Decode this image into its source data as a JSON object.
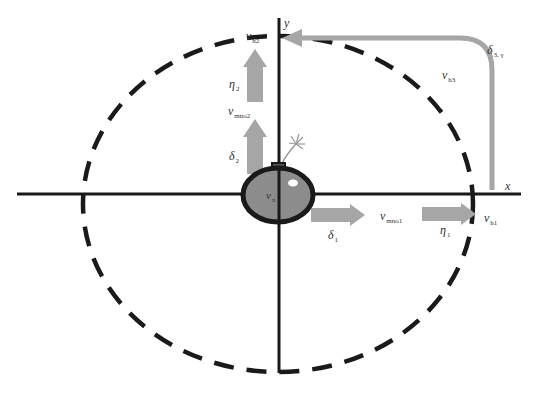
{
  "diagram": {
    "colors": {
      "axis": "#1a1a1a",
      "dashed_circle": "#1a1a1a",
      "arrow": "#a6a6a6",
      "bomb_fill": "#8c8c8c",
      "bomb_outline": "#1a1a1a",
      "highlight": "#ffffff"
    },
    "axes": {
      "x_label": "x",
      "y_label": "y"
    },
    "bomb": {
      "label_main": "v",
      "label_sub": "x"
    },
    "labels": [
      {
        "id": "vh2",
        "main": "v",
        "sub": "h2"
      },
      {
        "id": "eta2",
        "main": "η",
        "sub": "2"
      },
      {
        "id": "vmno2",
        "main": "v",
        "sub": "mno2"
      },
      {
        "id": "delta2",
        "main": "δ",
        "sub": "2"
      },
      {
        "id": "delta1",
        "main": "δ",
        "sub": "1"
      },
      {
        "id": "vmno1",
        "main": "v",
        "sub": "mno1"
      },
      {
        "id": "eta1",
        "main": "η",
        "sub": "1"
      },
      {
        "id": "vh1",
        "main": "v",
        "sub": "h1"
      },
      {
        "id": "vh3",
        "main": "v",
        "sub": "h3"
      },
      {
        "id": "delta3",
        "main": "δ",
        "sub": "3, γ"
      }
    ]
  }
}
